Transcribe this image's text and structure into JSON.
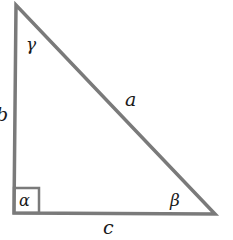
{
  "diagram": {
    "type": "right-triangle",
    "stroke_color": "#7a7a7a",
    "vertices": {
      "top": [
        16,
        5
      ],
      "bottom_left": [
        14,
        213
      ],
      "bottom_right": [
        215,
        214
      ]
    },
    "sides": {
      "a": "a",
      "b": "b",
      "c": "c"
    },
    "angles": {
      "alpha": "α",
      "beta": "β",
      "gamma": "γ"
    },
    "right_angle_at": "alpha"
  }
}
